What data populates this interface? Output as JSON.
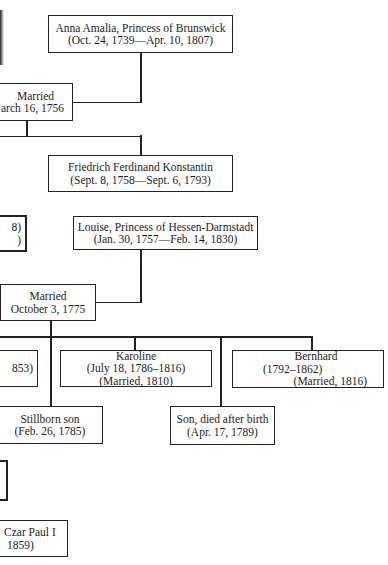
{
  "diagram": {
    "type": "family-tree",
    "nodes": {
      "anna_amalia": {
        "name": "Anna Amalia, Princess of Brunswick",
        "dates": "(Oct. 24, 1739—Apr. 10, 1807)"
      },
      "marriage_1756": {
        "label": "Married",
        "date": "arch 16, 1756"
      },
      "friedrich": {
        "name": "Friedrich Ferdinand Konstantin",
        "dates": "(Sept. 8, 1758—Sept. 6, 1793)"
      },
      "partial_left_top": {
        "line1": "8)",
        "line2": ")"
      },
      "louise": {
        "name": "Louise, Princess of Hessen-Darmstadt",
        "dates": "(Jan. 30, 1757—Feb. 14, 1830)"
      },
      "marriage_1775": {
        "label": "Married",
        "date": "October 3, 1775"
      },
      "partial_left_child": {
        "line1": "853)"
      },
      "karoline": {
        "name": "Karoline",
        "dates": "(July 18, 1786–1816)",
        "note": "(Married, 1810)"
      },
      "bernhard": {
        "name": "Bernhard",
        "dates": "(1792–1862)",
        "note": "(Married, 1816)"
      },
      "stillborn_son": {
        "name": "Stillborn son",
        "dates": "(Feb. 26, 1785)"
      },
      "son_died": {
        "name": "Son, died after birth",
        "dates": "(Apr. 17, 1789)"
      },
      "czar_paul": {
        "line1": "Czar Paul I",
        "line2": "1859)"
      }
    },
    "edges": [
      [
        "anna_amalia",
        "marriage_1756"
      ],
      [
        "marriage_1756",
        "friedrich"
      ],
      [
        "louise",
        "marriage_1775"
      ],
      [
        "marriage_1775",
        "partial_left_child"
      ],
      [
        "marriage_1775",
        "karoline"
      ],
      [
        "marriage_1775",
        "bernhard"
      ],
      [
        "marriage_1775",
        "stillborn_son"
      ],
      [
        "marriage_1775",
        "son_died"
      ]
    ]
  }
}
